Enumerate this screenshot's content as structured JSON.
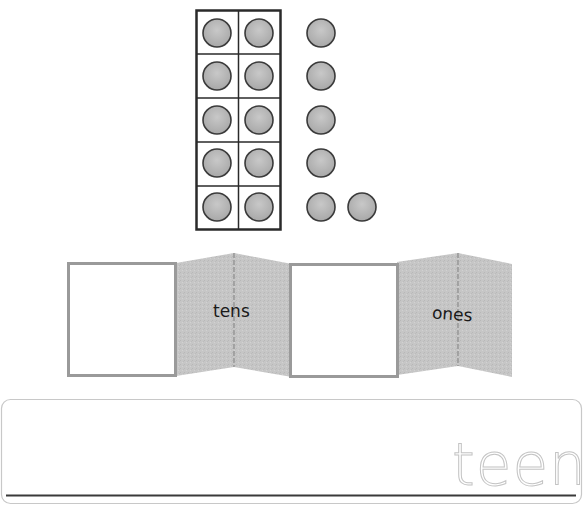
{
  "worksheet": {
    "ten_frame": {
      "rows": 5,
      "cols": 2,
      "filled_cells": 10,
      "dot_color": "#b4b4b4",
      "dot_stroke": "#3a3a3a",
      "frame_stroke": "#2a2a2a"
    },
    "extra_counters": {
      "count": 6,
      "layout": "column of 5 plus 1 beside the bottom"
    },
    "fold_strip": {
      "panels": [
        {
          "type": "answer-box",
          "label": ""
        },
        {
          "type": "fold-panel",
          "label": "tens"
        },
        {
          "type": "answer-box",
          "label": ""
        },
        {
          "type": "fold-panel",
          "label": "ones"
        }
      ],
      "panel_color": "#c6c6c6",
      "box_border_color": "#9a9a9a"
    },
    "writing_line": {
      "trace_word": "teen",
      "trace_color": "#c4c4c4",
      "baseline_color": "#3a3a3a",
      "border_color": "#c8c8c8"
    }
  }
}
